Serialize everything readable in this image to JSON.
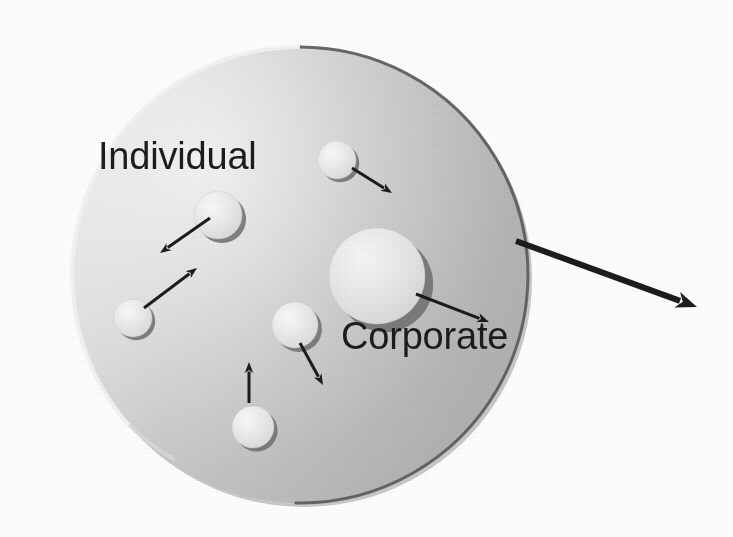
{
  "image": {
    "kind": "scanned-diagram",
    "width": 733,
    "height": 537,
    "background_color": "#ffffff"
  },
  "labels": {
    "individual": "Individual",
    "corporate": "Corporate"
  },
  "colors": {
    "background": "#ffffff",
    "big_circle_light": "#e9e9e9",
    "big_circle_mid": "#d2d2d2",
    "big_circle_dark": "#b8b8b8",
    "big_circle_outline": "#5a5a5a",
    "node_fill_light": "#efefef",
    "node_fill_dark": "#d8d8d8",
    "node_shadow": "#6f6f6f",
    "arrow": "#1c1c1c",
    "text": "#1c1c1c"
  },
  "big_circle": {
    "name": "market-boundary-circle",
    "cx": 300,
    "cy": 275,
    "r": 228,
    "outline_width": 3
  },
  "nodes": [
    {
      "id": "node-top",
      "label": "",
      "cx": 337,
      "cy": 160,
      "r": 19
    },
    {
      "id": "node-individual",
      "label": "",
      "cx": 218,
      "cy": 215,
      "r": 24
    },
    {
      "id": "node-lower-left",
      "label": "",
      "cx": 133,
      "cy": 318,
      "r": 19
    },
    {
      "id": "node-middle",
      "label": "",
      "cx": 295,
      "cy": 325,
      "r": 23
    },
    {
      "id": "node-bottom",
      "label": "",
      "cx": 253,
      "cy": 427,
      "r": 21
    },
    {
      "id": "node-corporate",
      "label": "",
      "cx": 377,
      "cy": 276,
      "r": 48
    }
  ],
  "arrows": [
    {
      "id": "arrow-top-out",
      "x1": 352,
      "y1": 168,
      "x2": 392,
      "y2": 193,
      "width": 3,
      "head": 11
    },
    {
      "id": "arrow-individual-out",
      "x1": 210,
      "y1": 218,
      "x2": 160,
      "y2": 253,
      "width": 3,
      "head": 11
    },
    {
      "id": "arrow-lower-left-in",
      "x1": 144,
      "y1": 308,
      "x2": 197,
      "y2": 268,
      "width": 3,
      "head": 11
    },
    {
      "id": "arrow-middle-out",
      "x1": 300,
      "y1": 343,
      "x2": 323,
      "y2": 385,
      "width": 3,
      "head": 11
    },
    {
      "id": "arrow-bottom-in",
      "x1": 249,
      "y1": 403,
      "x2": 249,
      "y2": 362,
      "width": 3,
      "head": 11
    },
    {
      "id": "arrow-corporate-out",
      "x1": 416,
      "y1": 294,
      "x2": 489,
      "y2": 322,
      "width": 3,
      "head": 12
    },
    {
      "id": "arrow-export-main",
      "x1": 516,
      "y1": 241,
      "x2": 697,
      "y2": 307,
      "width": 6,
      "head": 21
    }
  ],
  "semantics": {
    "description_nodes": "light spheres inside the large boundary circle",
    "description_export_arrow": "thick arrow leaving the boundary circle to the right"
  }
}
